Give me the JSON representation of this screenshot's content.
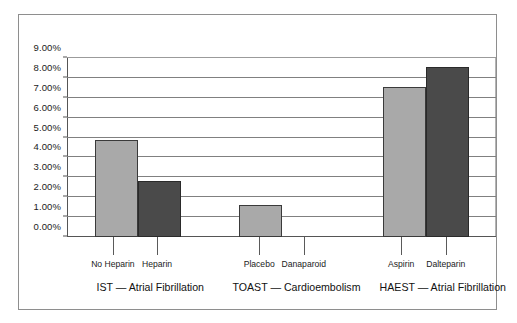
{
  "chart_data": {
    "type": "bar",
    "title": "",
    "subtitle": "",
    "xlabel": "",
    "ylabel": "",
    "ylim": [
      0,
      9
    ],
    "ytick_values": [
      0,
      1,
      2,
      3,
      4,
      5,
      6,
      7,
      8,
      9
    ],
    "ytick_labels": [
      "0.00%",
      "1.00%",
      "2.00%",
      "3.00%",
      "4.00%",
      "5.00%",
      "6.00%",
      "7.00%",
      "8.00%",
      "9.00%"
    ],
    "grid": true,
    "grid_axis": "y",
    "legend": false,
    "legend_position": "none",
    "categories": [
      "No Heparin",
      "Heparin",
      "Placebo",
      "Danaparoid",
      "Aspirin",
      "Dalteparin"
    ],
    "values": [
      4.9,
      2.8,
      1.6,
      0,
      7.55,
      8.55
    ],
    "value_unit": "%",
    "colors": {
      "light_bar": "#a9a9a9",
      "dark_bar": "#4a4a4a",
      "bar_outline": "#3a3a3a",
      "gridline": "#808080",
      "axis": "#555555",
      "frame": "#8e8e8e",
      "background": "#ffffff",
      "text": "#1b1b1b"
    },
    "groups": [
      {
        "label": "IST — Atrial Fibrillation",
        "center_pct": 19.4,
        "bars": [
          {
            "label": "No Heparin",
            "value": 4.9,
            "shade": "light",
            "x_pct": 6.5,
            "w_pct": 10.0,
            "tick_pct": 10.7
          },
          {
            "label": "Heparin",
            "value": 2.8,
            "shade": "dark",
            "x_pct": 16.5,
            "w_pct": 10.0,
            "tick_pct": 21.0
          }
        ]
      },
      {
        "label": "TOAST — Cardioembolism",
        "center_pct": 53.5,
        "bars": [
          {
            "label": "Placebo",
            "value": 1.6,
            "shade": "light",
            "x_pct": 40.1,
            "w_pct": 10.0,
            "tick_pct": 44.8
          },
          {
            "label": "Danaparoid",
            "value": 0,
            "shade": "dark",
            "x_pct": 50.1,
            "w_pct": 10.0,
            "tick_pct": 55.2
          }
        ]
      },
      {
        "label": "HAEST — Atrial Fibrillation",
        "center_pct": 87.6,
        "bars": [
          {
            "label": "Aspirin",
            "value": 7.55,
            "shade": "light",
            "x_pct": 73.7,
            "w_pct": 10.0,
            "tick_pct": 77.9
          },
          {
            "label": "Dalteparin",
            "value": 8.55,
            "shade": "dark",
            "x_pct": 83.7,
            "w_pct": 10.0,
            "tick_pct": 88.3
          }
        ]
      }
    ]
  }
}
